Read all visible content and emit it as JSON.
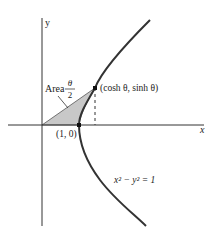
{
  "diagram": {
    "type": "hyperbola-figure",
    "axes": {
      "x_label": "x",
      "y_label": "y"
    },
    "curve": {
      "equation_label": "x² − y² = 1",
      "color": "#333333"
    },
    "shaded_region": {
      "label_prefix": "Area",
      "fraction_numerator": "θ",
      "fraction_denominator": "2",
      "fill": "#c8c8c8"
    },
    "points": [
      {
        "label": "(1, 0)"
      },
      {
        "label": "(cosh θ,  sinh θ)"
      }
    ]
  }
}
